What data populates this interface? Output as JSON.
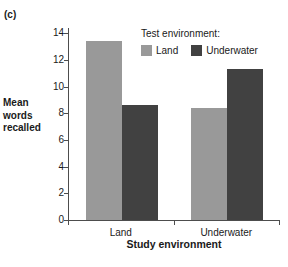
{
  "panel": {
    "label": "(c)"
  },
  "axes": {
    "ylabel_lines": [
      "Mean",
      "words",
      "recalled"
    ],
    "xlabel": "Study environment",
    "ytick_labels": [
      "0",
      "2",
      "4",
      "6",
      "8",
      "10",
      "12",
      "14"
    ]
  },
  "legend": {
    "title": "Test environment:",
    "items": [
      {
        "label": "Land",
        "color": "#999999"
      },
      {
        "label": "Underwater",
        "color": "#414141"
      }
    ]
  },
  "colors": {
    "land": "#999999",
    "underwater": "#414141",
    "axis": "#4d4d4d",
    "text": "#1a1a1a",
    "background": "#ffffff"
  },
  "chart_data": {
    "type": "bar",
    "title": "(c)",
    "xlabel": "Study environment",
    "ylabel": "Mean words recalled",
    "categories": [
      "Land",
      "Underwater"
    ],
    "series": [
      {
        "name": "Land",
        "color": "#999999",
        "values": [
          13.4,
          8.4
        ]
      },
      {
        "name": "Underwater",
        "color": "#414141",
        "values": [
          8.6,
          11.3
        ]
      }
    ],
    "legend_title": "Test environment:",
    "legend_position": "top-right inside",
    "ylim": [
      0,
      14.4
    ],
    "ytick_values": [
      0,
      2,
      4,
      6,
      8,
      10,
      12,
      14
    ],
    "grid": false,
    "bar_group_order": [
      "Land",
      "Underwater"
    ]
  }
}
